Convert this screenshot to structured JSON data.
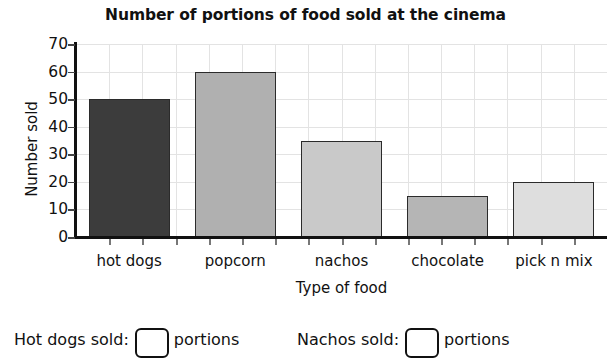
{
  "chart_data": {
    "type": "bar",
    "title": "Number of portions of food sold at the cinema",
    "xlabel": "Type of food",
    "ylabel": "Number sold",
    "categories": [
      "hot dogs",
      "popcorn",
      "nachos",
      "chocolate",
      "pick n mix"
    ],
    "values": [
      50,
      60,
      35,
      15,
      20
    ],
    "bar_colors": [
      "#3c3c3c",
      "#b0b0b0",
      "#c9c9c9",
      "#b5b5b5",
      "#dedede"
    ],
    "ylim": [
      0,
      70
    ],
    "ytick_labels": [
      "70",
      "60",
      "50",
      "40",
      "30",
      "20",
      "10",
      "0"
    ],
    "ytick_values": [
      70,
      60,
      50,
      40,
      30,
      20,
      10,
      0
    ],
    "ytick_step": 10,
    "grid": "both",
    "legend": "none",
    "minor_vertical_gridlines": 16
  },
  "questions": [
    {
      "id": "hot-dogs",
      "label": "Hot dogs sold:",
      "value": "",
      "placeholder": "",
      "unit": "portions"
    },
    {
      "id": "nachos",
      "label": "Nachos sold:",
      "value": "",
      "placeholder": "",
      "unit": "portions"
    }
  ]
}
